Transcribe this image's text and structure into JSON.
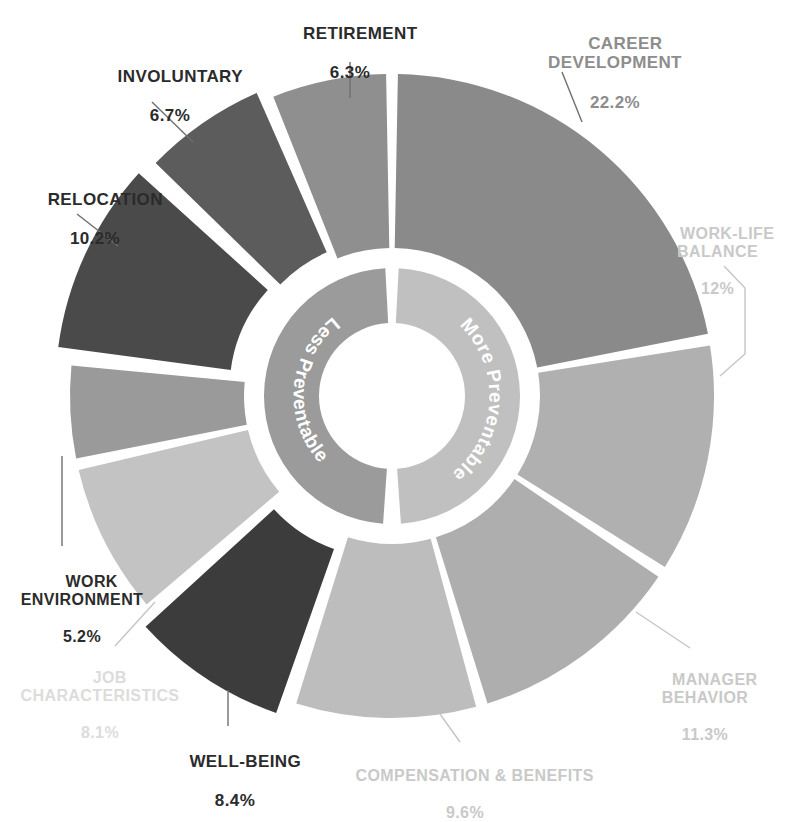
{
  "chart_data": {
    "type": "pie",
    "title": "",
    "subtitle": "",
    "xlabel": "",
    "ylabel": "",
    "legend_position": "none",
    "grid": false,
    "units": "percent",
    "chart_style": "donut with exploded slices and inner annulus",
    "categories": [
      "CAREER DEVELOPMENT",
      "WORK-LIFE BALANCE",
      "MANAGER BEHAVIOR",
      "COMPENSATION & BENEFITS",
      "WELL-BEING",
      "JOB CHARACTERISTICS",
      "WORK ENVIRONMENT",
      "RELOCATION",
      "INVOLUNTARY",
      "RETIREMENT"
    ],
    "values": [
      22.2,
      12.0,
      11.3,
      9.6,
      8.4,
      8.1,
      5.2,
      10.2,
      6.7,
      6.3
    ],
    "value_labels": [
      "22.2%",
      "12%",
      "11.3%",
      "9.6%",
      "8.4%",
      "8.1%",
      "5.2%",
      "10.2%",
      "6.7%",
      "6.3%"
    ],
    "slice_colors": [
      "#8a8a8a",
      "#b0b0b0",
      "#aeaeae",
      "#bdbdbd",
      "#3c3c3c",
      "#c3c3c3",
      "#9a9a9a",
      "#4a4a4a",
      "#5c5c5c",
      "#8f8f8f"
    ],
    "inner_ring": {
      "segments": [
        {
          "label": "Less Preventable",
          "color": "#9b9b9b"
        },
        {
          "label": "More Preventable",
          "color": "#c0c0c0"
        }
      ]
    }
  },
  "labels": {
    "retirement": {
      "name": "RETIREMENT",
      "pct": "6.3%"
    },
    "involuntary": {
      "name": "INVOLUNTARY",
      "pct": "6.7%"
    },
    "relocation": {
      "name": "RELOCATION",
      "pct": "10.2%"
    },
    "work_env": {
      "name": "WORK\nENVIRONMENT",
      "pct": "5.2%"
    },
    "job_char": {
      "name": "JOB\nCHARACTERISTICS",
      "pct": "8.1%"
    },
    "well_being": {
      "name": "WELL-BEING",
      "pct": "8.4%"
    },
    "comp_ben": {
      "name": "COMPENSATION & BENEFITS",
      "pct": "9.6%"
    },
    "manager": {
      "name": "MANAGER\nBEHAVIOR",
      "pct": "11.3%"
    },
    "wlb": {
      "name": "WORK-LIFE\nBALANCE",
      "pct": "12%"
    },
    "career": {
      "name": "CAREER\nDEVELOPMENT",
      "pct": "22.2%"
    }
  },
  "ring_labels": {
    "less": "Less Preventable",
    "more": "More Preventable"
  },
  "colors": {
    "background": "#ffffff",
    "leader_line": "#6f6f6f",
    "leader_line_light": "#c5c5c5",
    "text_dark": "#2b2b2b",
    "text_mid": "#8d8d8d",
    "text_light": "#c9c9c9"
  }
}
